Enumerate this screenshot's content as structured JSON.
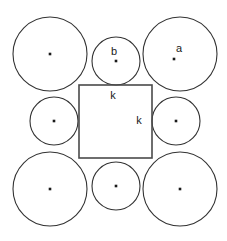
{
  "figure": {
    "background_color": "#ffffff",
    "stroke_color": "#333333",
    "square_stroke_color": "#4a4a4a",
    "dot_color": "#1a1a1a",
    "width": 227,
    "height": 241,
    "circles": [
      {
        "id": "circle-top-left",
        "name": "large-circle-top-left",
        "cx": 50,
        "cy": 54,
        "r": 37,
        "size": "large",
        "label": null
      },
      {
        "id": "circle-top-middle",
        "name": "small-circle-top-middle",
        "cx": 116,
        "cy": 61,
        "r": 24,
        "size": "small",
        "label": "b"
      },
      {
        "id": "circle-top-right",
        "name": "large-circle-top-right",
        "cx": 180,
        "cy": 54,
        "r": 37,
        "size": "large",
        "label": "a"
      },
      {
        "id": "circle-middle-left",
        "name": "small-circle-middle-left",
        "cx": 54,
        "cy": 121,
        "r": 24,
        "size": "small",
        "label": null
      },
      {
        "id": "circle-middle-right",
        "name": "small-circle-middle-right",
        "cx": 176,
        "cy": 121,
        "r": 24,
        "size": "small",
        "label": null
      },
      {
        "id": "circle-bottom-left",
        "name": "large-circle-bottom-left",
        "cx": 50,
        "cy": 189,
        "r": 37,
        "size": "large",
        "label": null
      },
      {
        "id": "circle-bottom-middle",
        "name": "small-circle-bottom-middle",
        "cx": 116,
        "cy": 186,
        "r": 24,
        "size": "small",
        "label": null
      },
      {
        "id": "circle-bottom-right",
        "name": "large-circle-bottom-right",
        "cx": 180,
        "cy": 189,
        "r": 37,
        "size": "large",
        "label": null
      }
    ],
    "square": {
      "x": 79,
      "y": 85,
      "width": 73,
      "height": 73
    },
    "labels": {
      "radius_a": "a",
      "radius_b": "b",
      "side_k_top": "k",
      "side_k_right": "k"
    },
    "label_positions": {
      "a": {
        "x": 179,
        "y": 52
      },
      "b": {
        "x": 114,
        "y": 55
      },
      "k_top": {
        "x": 113,
        "y": 99
      },
      "k_right": {
        "x": 139,
        "y": 124
      }
    }
  }
}
